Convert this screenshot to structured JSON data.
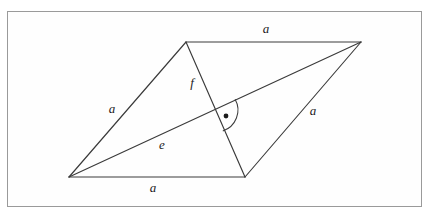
{
  "figure": {
    "frame": {
      "x": 7,
      "y": 11,
      "width": 415,
      "height": 196,
      "border_color": "#9a9a9a",
      "background_color": "#fefefe"
    },
    "canvas": {
      "width": 433,
      "height": 218
    },
    "stroke_color": "#3a3a3a",
    "label_color": "#1b1b1b",
    "vertices": {
      "top_left": {
        "name": "B",
        "x": 186,
        "y": 42
      },
      "top_right": {
        "name": "C",
        "x": 361,
        "y": 42
      },
      "bottom_right": {
        "name": "D",
        "x": 245,
        "y": 177
      },
      "bottom_left": {
        "name": "A",
        "x": 69,
        "y": 177
      }
    },
    "intersection": {
      "name": "M",
      "x": 215.25,
      "y": 109.5
    },
    "edges": [
      {
        "name": "top-edge",
        "label": "a",
        "from": "top_left",
        "to": "top_right",
        "label_x": 266,
        "label_y": 30
      },
      {
        "name": "right-edge",
        "label": "a",
        "from": "top_right",
        "to": "bottom_right",
        "label_x": 313,
        "label_y": 112
      },
      {
        "name": "bottom-edge",
        "label": "a",
        "from": "bottom_right",
        "to": "bottom_left",
        "label_x": 153,
        "label_y": 189
      },
      {
        "name": "left-edge",
        "label": "a",
        "from": "bottom_left",
        "to": "top_left",
        "label_x": 112,
        "label_y": 110
      }
    ],
    "diagonals": [
      {
        "name": "long-diagonal",
        "label": "e",
        "from": "bottom_left",
        "to": "top_right",
        "label_x": 162,
        "label_y": 146
      },
      {
        "name": "short-diagonal",
        "label": "f",
        "from": "top_left",
        "to": "bottom_right",
        "label_x": 192,
        "label_y": 84
      }
    ],
    "right_angle_mark": {
      "name": "right-angle-mark",
      "radius": 22,
      "dot_radius": 2.4,
      "dot_x": 226,
      "dot_y": 116,
      "arc_path": "M 232.40 94.31 A 22 22 0 0 1 224.20 129.67",
      "description": "arc with centered dot indicating 90 degrees"
    }
  }
}
